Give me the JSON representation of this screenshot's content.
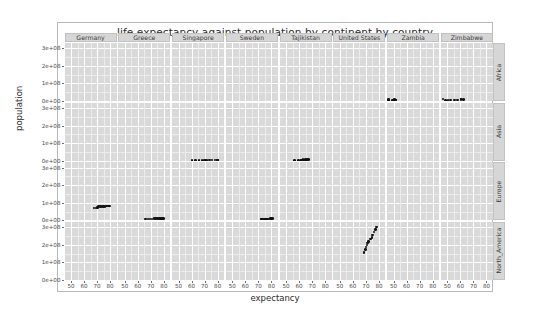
{
  "chart_data": {
    "type": "scatter",
    "title": "life expectancy against population by continent by country",
    "xlabel": "expectancy",
    "ylabel": "population",
    "facet_columns": [
      "Germany",
      "Greece",
      "Singapore",
      "Sweden",
      "Tajikistan",
      "United States",
      "Zambia",
      "Zimbabwe"
    ],
    "facet_rows": [
      "Africa",
      "Asia",
      "Europe",
      "North_America"
    ],
    "xlim": [
      45,
      85
    ],
    "xticks": [
      50,
      60,
      70,
      80
    ],
    "xtick_labels": [
      "50",
      "60",
      "70",
      "80"
    ],
    "ylim": [
      0,
      330000000
    ],
    "yticks": [
      0,
      100000000,
      200000000,
      300000000
    ],
    "ytick_labels": [
      "0e+00",
      "1e+08",
      "2e+08",
      "3e+08"
    ],
    "grid": true,
    "legend": "none",
    "point_color": "#111111",
    "panel_color": "#d9d9d9",
    "strip_color": "#d6d6d6",
    "series": [
      {
        "name": "Zambia",
        "row": "Africa",
        "column": "Zambia",
        "x": [
          46.0,
          49.0,
          50.1,
          51.4,
          51.8,
          50.8,
          46.1,
          40.2,
          39.2,
          42.4
        ],
        "y": [
          3000000,
          3600000,
          4300000,
          5100000,
          6100000,
          7300000,
          8400000,
          9400000,
          10600000,
          11700000
        ]
      },
      {
        "name": "Zimbabwe",
        "row": "Africa",
        "column": "Zimbabwe",
        "x": [
          48.5,
          50.5,
          52.4,
          55.6,
          57.7,
          60.4,
          62.4,
          60.4,
          46.8,
          43.5
        ],
        "y": [
          3800000,
          4400000,
          5000000,
          5900000,
          7000000,
          8400000,
          10000000,
          11400000,
          11900000,
          12300000
        ]
      },
      {
        "name": "Singapore",
        "row": "Asia",
        "column": "Singapore",
        "x": [
          60.4,
          63.2,
          65.8,
          67.9,
          69.5,
          70.8,
          71.8,
          73.6,
          75.8,
          78.0,
          79.9,
          80.0
        ],
        "y": [
          1100000,
          1300000,
          1700000,
          2000000,
          2300000,
          2400000,
          2500000,
          2800000,
          3200000,
          3800000,
          4000000,
          4500000
        ]
      },
      {
        "name": "Tajikistan",
        "row": "Asia",
        "column": "Tajikistan",
        "x": [
          56.3,
          59.6,
          61.9,
          63.7,
          65.5,
          62.8,
          61.8,
          62.0,
          63.1,
          64.8,
          66.0,
          67.0
        ],
        "y": [
          1500000,
          1800000,
          2100000,
          2500000,
          3000000,
          3500000,
          4100000,
          4800000,
          5300000,
          6000000,
          6500000,
          7000000
        ]
      },
      {
        "name": "Germany",
        "row": "Europe",
        "column": "Germany",
        "x": [
          67.5,
          69.1,
          70.3,
          70.8,
          71.0,
          72.5,
          73.8,
          74.8,
          76.1,
          77.3,
          78.7,
          79.4
        ],
        "y": [
          69100000,
          71000000,
          73700000,
          76200000,
          78100000,
          78200000,
          78300000,
          77700000,
          79400000,
          82100000,
          82300000,
          82400000
        ]
      },
      {
        "name": "Greece",
        "row": "Europe",
        "column": "Greece",
        "x": [
          65.9,
          67.9,
          69.5,
          71.0,
          72.3,
          73.7,
          75.2,
          76.7,
          77.3,
          78.3,
          78.6,
          79.5
        ],
        "y": [
          7700000,
          8100000,
          8400000,
          8700000,
          8900000,
          9300000,
          9900000,
          10100000,
          10200000,
          10600000,
          10800000,
          10700000
        ]
      },
      {
        "name": "Sweden",
        "row": "Europe",
        "column": "Sweden",
        "x": [
          71.9,
          72.5,
          73.4,
          74.0,
          74.7,
          75.4,
          76.4,
          77.1,
          78.2,
          79.4,
          80.0,
          80.9
        ],
        "y": [
          7100000,
          7400000,
          7500000,
          7800000,
          8100000,
          8300000,
          8300000,
          8400000,
          8600000,
          8900000,
          8900000,
          9000000
        ]
      },
      {
        "name": "United States",
        "row": "North_America",
        "column": "United States",
        "x": [
          68.4,
          69.5,
          70.2,
          70.8,
          71.3,
          72.0,
          73.4,
          74.6,
          75.0,
          76.1,
          77.3,
          78.2
        ],
        "y": [
          157553000,
          171984000,
          186538000,
          198712000,
          209896000,
          220239000,
          232187000,
          242804000,
          256894000,
          272912000,
          287675000,
          301140000
        ]
      }
    ]
  }
}
